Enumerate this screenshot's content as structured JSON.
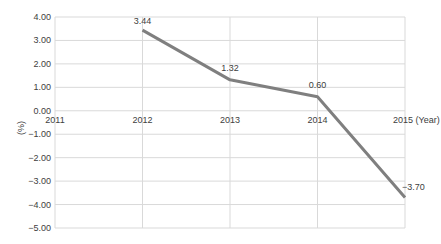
{
  "chart_data": {
    "type": "line",
    "title": "",
    "xlabel": "(Year)",
    "ylabel": "(%)",
    "categories": [
      "2011",
      "2012",
      "2013",
      "2014",
      "2015"
    ],
    "series": [
      {
        "name": "Growth rate",
        "x": [
          "2012",
          "2013",
          "2014",
          "2015"
        ],
        "values": [
          3.44,
          1.32,
          0.6,
          -3.7
        ],
        "color": "#7f7f7f"
      }
    ],
    "data_labels": [
      "3.44",
      "1.32",
      "0.60",
      "-3.70"
    ],
    "yticks": [
      "4.00",
      "3.00",
      "2.00",
      "1.00",
      "0.00",
      "-1.00",
      "-2.00",
      "-3.00",
      "-4.00",
      "-5.00"
    ],
    "ylim": [
      -5,
      4
    ],
    "grid": true,
    "legend": "none"
  },
  "colors": {
    "line": "#7f7f7f",
    "grid": "#d9d9d9",
    "text": "#404040"
  }
}
